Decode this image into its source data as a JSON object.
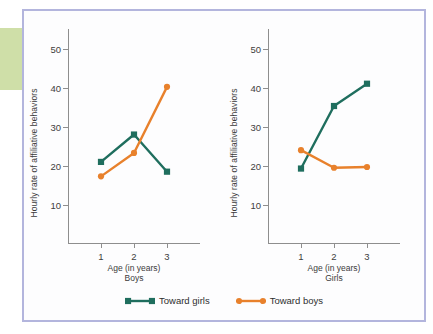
{
  "figure": {
    "ylabel": "Hourly rate of affiliative behaviors",
    "xlabel": "Age (in years)",
    "yticks": [
      "50",
      "40",
      "30",
      "20",
      "10"
    ],
    "xticks": [
      "1",
      "2",
      "3"
    ],
    "panel_boys_label": "Boys",
    "panel_girls_label": "Girls",
    "page_tab_mark": "s"
  },
  "legend": {
    "items": [
      {
        "label": "Toward girls",
        "color": "#1f6e5e",
        "marker": "square"
      },
      {
        "label": "Toward boys",
        "color": "#e8812c",
        "marker": "circle"
      }
    ]
  },
  "colors": {
    "toward_girls": "#1f6e5e",
    "toward_boys": "#e8812c",
    "frame_border": "#b3b5dd",
    "axis": "#8e8e8e",
    "page_tab": "#cfdfa8"
  },
  "chart_data": [
    {
      "type": "line",
      "title": "Boys",
      "xlabel": "Age (in years)",
      "ylabel": "Hourly rate of affiliative behaviors",
      "categories": [
        "1",
        "2",
        "3"
      ],
      "x": [
        1,
        2,
        3
      ],
      "ylim": [
        0,
        55
      ],
      "yticks": [
        10,
        20,
        30,
        40,
        50
      ],
      "grid": false,
      "legend_position": "bottom-center",
      "series": [
        {
          "name": "Toward girls",
          "color": "#1f6e5e",
          "marker": "square",
          "values": [
            21.0,
            28.0,
            18.5
          ]
        },
        {
          "name": "Toward boys",
          "color": "#e8812c",
          "marker": "circle",
          "values": [
            17.3,
            23.3,
            40.2
          ]
        }
      ]
    },
    {
      "type": "line",
      "title": "Girls",
      "xlabel": "Age (in years)",
      "ylabel": "Hourly rate of affiliative behaviors",
      "categories": [
        "1",
        "2",
        "3"
      ],
      "x": [
        1,
        2,
        3
      ],
      "ylim": [
        0,
        55
      ],
      "yticks": [
        10,
        20,
        30,
        40,
        50
      ],
      "grid": false,
      "legend_position": "bottom-center",
      "series": [
        {
          "name": "Toward girls",
          "color": "#1f6e5e",
          "marker": "square",
          "values": [
            19.3,
            35.3,
            41.0
          ]
        },
        {
          "name": "Toward boys",
          "color": "#e8812c",
          "marker": "circle",
          "values": [
            24.0,
            19.5,
            19.7
          ]
        }
      ]
    }
  ]
}
